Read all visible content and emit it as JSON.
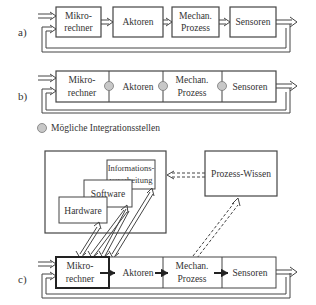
{
  "diagram": {
    "panel_a": {
      "label": "a)",
      "blocks": [
        {
          "line1": "Mikro-",
          "line2": "rechner"
        },
        {
          "line1": "Aktoren",
          "line2": ""
        },
        {
          "line1": "Mechan.",
          "line2": "Prozess"
        },
        {
          "line1": "Sensoren",
          "line2": ""
        }
      ]
    },
    "panel_b": {
      "label": "b)",
      "blocks": [
        {
          "line1": "Mikro-",
          "line2": "rechner"
        },
        {
          "line1": "Aktoren",
          "line2": ""
        },
        {
          "line1": "Mechan.",
          "line2": "Prozess"
        },
        {
          "line1": "Sensoren",
          "line2": ""
        }
      ],
      "legend": "Mögliche Integrationsstellen"
    },
    "panel_c": {
      "label": "c)",
      "blocks": [
        {
          "line1": "Mikro-",
          "line2": "rechner"
        },
        {
          "line1": "Aktoren",
          "line2": ""
        },
        {
          "line1": "Mechan.",
          "line2": "Prozess"
        },
        {
          "line1": "Sensoren",
          "line2": ""
        }
      ],
      "layers": {
        "hardware": "Hardware",
        "software": "Software",
        "info_line1": "Informations-",
        "info_line2": "verarbeitung"
      },
      "knowledge": "Prozess-Wissen"
    }
  },
  "colors": {
    "line": "#444444",
    "text": "#333333",
    "circle_fill": "#c8c8c8"
  }
}
